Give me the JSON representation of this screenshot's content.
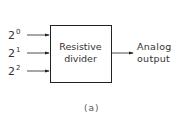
{
  "diagram": {
    "inputs": [
      {
        "base": "2",
        "exponent": "0"
      },
      {
        "base": "2",
        "exponent": "1"
      },
      {
        "base": "2",
        "exponent": "2"
      }
    ],
    "block": {
      "line1": "Resistive",
      "line2": "divider"
    },
    "output": {
      "line1": "Analog",
      "line2": "output"
    },
    "caption": "(a)"
  }
}
